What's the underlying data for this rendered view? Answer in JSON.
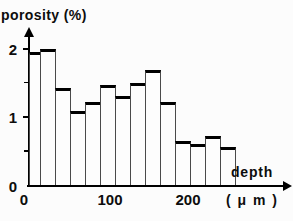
{
  "chart_data": {
    "type": "bar",
    "subtype": "histogram",
    "title": "porosity (%)",
    "ylabel": "porosity (%)",
    "xlabel": "depth (μm)",
    "xlabel_line1": "depth",
    "xlabel_line2": "( μ m )",
    "x_unit": "μm",
    "y_unit": "%",
    "ylim": [
      0,
      2.2
    ],
    "xlim": [
      0,
      280
    ],
    "grid": false,
    "legend": "none",
    "x_ticks": [
      {
        "label": "0",
        "value_um": 0,
        "x_px": 24
      },
      {
        "label": "100",
        "value_um": 100,
        "x_px": 110
      },
      {
        "label": "200",
        "value_um": 200,
        "x_px": 188
      }
    ],
    "y_ticks": [
      {
        "label": "0",
        "value": 0,
        "minor": false
      },
      {
        "label": "",
        "value": 0.5,
        "minor": true
      },
      {
        "label": "1",
        "value": 1,
        "minor": false
      },
      {
        "label": "",
        "value": 1.5,
        "minor": true
      },
      {
        "label": "2",
        "value": 2,
        "minor": false
      }
    ],
    "bars": [
      {
        "depth_um": [
          0,
          10
        ],
        "porosity_pct": 1.95
      },
      {
        "depth_um": [
          10,
          30
        ],
        "porosity_pct": 2.0
      },
      {
        "depth_um": [
          30,
          50
        ],
        "porosity_pct": 1.43
      },
      {
        "depth_um": [
          50,
          70
        ],
        "porosity_pct": 1.09
      },
      {
        "depth_um": [
          70,
          90
        ],
        "porosity_pct": 1.23
      },
      {
        "depth_um": [
          90,
          110
        ],
        "porosity_pct": 1.47
      },
      {
        "depth_um": [
          110,
          130
        ],
        "porosity_pct": 1.31
      },
      {
        "depth_um": [
          130,
          150
        ],
        "porosity_pct": 1.51
      },
      {
        "depth_um": [
          150,
          170
        ],
        "porosity_pct": 1.69
      },
      {
        "depth_um": [
          170,
          190
        ],
        "porosity_pct": 1.23
      },
      {
        "depth_um": [
          190,
          210
        ],
        "porosity_pct": 0.66
      },
      {
        "depth_um": [
          210,
          230
        ],
        "porosity_pct": 0.61
      },
      {
        "depth_um": [
          230,
          250
        ],
        "porosity_pct": 0.73
      },
      {
        "depth_um": [
          250,
          270
        ],
        "porosity_pct": 0.57
      }
    ],
    "layout": {
      "bar_edges_px": [
        29,
        40,
        55,
        70,
        85,
        100,
        115,
        130,
        145,
        160,
        175,
        190,
        205,
        220,
        235
      ],
      "axis_origin_px": {
        "x": 29,
        "y": 185.5
      },
      "px_per_unit_y": 68.5,
      "tick_len_px": 6,
      "minor_tick_len_px": 5,
      "bar_fill": "#fdfdfd",
      "ink": "#000000"
    }
  }
}
